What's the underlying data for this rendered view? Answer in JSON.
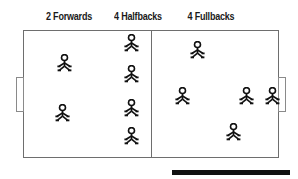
{
  "diagram": {
    "title_labels": [
      {
        "text": "2 Forwards",
        "x": 43,
        "y": 11,
        "w": 52
      },
      {
        "text": "4 Halfbacks",
        "x": 110,
        "y": 11,
        "w": 56
      },
      {
        "text": "4 Fullbacks",
        "x": 184,
        "y": 11,
        "w": 54
      }
    ],
    "field": {
      "x": 23,
      "y": 30,
      "w": 256,
      "h": 128
    },
    "halfway_line": {
      "x": 151,
      "y": 30,
      "h": 128
    },
    "goals": [
      {
        "name": "left-goal",
        "x": 16,
        "y": 77,
        "w": 8,
        "h": 35
      },
      {
        "name": "right-goal",
        "x": 278,
        "y": 77,
        "w": 8,
        "h": 35
      }
    ],
    "players": [
      {
        "group": "forward",
        "x": 56,
        "y": 54
      },
      {
        "group": "forward",
        "x": 54,
        "y": 104
      },
      {
        "group": "halfback",
        "x": 123,
        "y": 34
      },
      {
        "group": "halfback",
        "x": 123,
        "y": 65
      },
      {
        "group": "halfback",
        "x": 123,
        "y": 99
      },
      {
        "group": "halfback",
        "x": 123,
        "y": 127
      },
      {
        "group": "fullback",
        "x": 189,
        "y": 41
      },
      {
        "group": "fullback",
        "x": 174,
        "y": 87
      },
      {
        "group": "fullback",
        "x": 238,
        "y": 87
      },
      {
        "group": "fullback",
        "x": 225,
        "y": 123
      },
      {
        "group": "goalkeeper",
        "x": 264,
        "y": 87
      }
    ],
    "colors": {
      "field_border": "#6e6e6e",
      "goal_border": "#8a8a8a",
      "player": "#111111",
      "label_text": "#1a1a1a",
      "rule": "#111111",
      "background": "#ffffff"
    },
    "bottom_rule": {
      "x": 172,
      "y": 170,
      "w": 118,
      "h": 5
    },
    "icon_names": {
      "player": "stick-figure-icon"
    }
  }
}
